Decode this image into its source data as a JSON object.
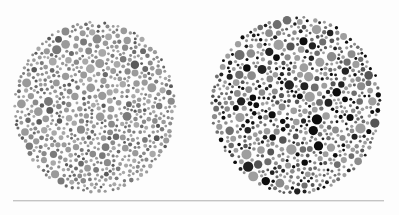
{
  "image": {
    "width": 399,
    "height": 215,
    "background": "#fdfdfd"
  },
  "plates": [
    {
      "name": "plate-left",
      "cx": 95,
      "cy": 107,
      "rx": 82,
      "ry": 87,
      "seed": 11,
      "dot_count": 900,
      "min_r": 1.4,
      "max_r": 4.6,
      "palette": [
        {
          "color": "#9a9a9a",
          "weight": 30
        },
        {
          "color": "#a9a9a9",
          "weight": 22
        },
        {
          "color": "#8a8a8a",
          "weight": 18
        },
        {
          "color": "#7a7a7a",
          "weight": 14
        },
        {
          "color": "#6a6a6a",
          "weight": 10
        },
        {
          "color": "#5a5a5a",
          "weight": 6
        }
      ]
    },
    {
      "name": "plate-right",
      "cx": 296,
      "cy": 105,
      "rx": 86,
      "ry": 90,
      "seed": 29,
      "dot_count": 760,
      "min_r": 1.4,
      "max_r": 5.2,
      "palette": [
        {
          "color": "#9e9e9e",
          "weight": 28
        },
        {
          "color": "#8c8c8c",
          "weight": 18
        },
        {
          "color": "#6e6e6e",
          "weight": 16
        },
        {
          "color": "#555555",
          "weight": 12
        },
        {
          "color": "#222222",
          "weight": 14
        },
        {
          "color": "#0d0d0d",
          "weight": 12
        }
      ]
    }
  ],
  "divider": {
    "x1": 13,
    "x2": 384,
    "y": 200,
    "color": "#c4c4c4"
  }
}
